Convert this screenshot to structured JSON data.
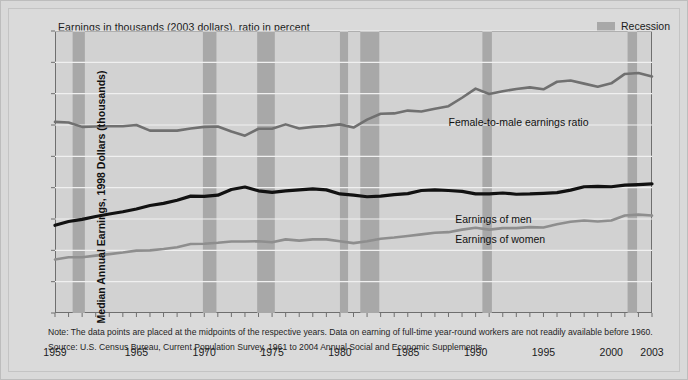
{
  "header": {
    "title": "Earnings in thousands (2003 dollars), ratio in percent",
    "legend_label": "Recession"
  },
  "axes": {
    "ylabel": "Median Annual Earnings, 1998 Dollars (thousands)",
    "yticks": [
      "0",
      "10",
      "20",
      "30",
      "40",
      "50",
      "60",
      "70",
      "80",
      "90"
    ],
    "xticks": [
      "1959",
      "1965",
      "1970",
      "1975",
      "1980",
      "1985",
      "1990",
      "1995",
      "2000",
      "2003"
    ]
  },
  "annotations": {
    "ratio": "Female-to-male earnings ratio",
    "men": "Earnings of men",
    "women": "Earnings of women"
  },
  "notes": {
    "note": "Note: The data points are placed at the midpoints of the respective years. Data on earning of full-time year-round workers are not readily available before 1960.",
    "source": "Source: U.S. Census Bureau, Current Population Survey, 1961 to 2004 Annual Social and Economic Supplements."
  },
  "colors": {
    "page_background": "#d9d9d9",
    "plot_background": "#d2d2d2",
    "recession_band": "#a8a8a8",
    "gridline": "#f0f0f0",
    "axis": "#6f6f6f",
    "men_line": "#111111",
    "women_line": "#8e8e8e",
    "ratio_line": "#707070"
  },
  "chart_data": {
    "type": "line",
    "title": "Earnings in thousands (2003 dollars), ratio in percent",
    "xlabel": "",
    "ylabel": "Median Annual Earnings, 1998 Dollars (thousands)",
    "xlim": [
      1959,
      2003
    ],
    "ylim": [
      0,
      90
    ],
    "grid": true,
    "legend_position": "inline-annotations",
    "x": [
      1959,
      1960,
      1961,
      1962,
      1963,
      1964,
      1965,
      1966,
      1967,
      1968,
      1969,
      1970,
      1971,
      1972,
      1973,
      1974,
      1975,
      1976,
      1977,
      1978,
      1979,
      1980,
      1981,
      1982,
      1983,
      1984,
      1985,
      1986,
      1987,
      1988,
      1989,
      1990,
      1991,
      1992,
      1993,
      1994,
      1995,
      1996,
      1997,
      1998,
      1999,
      2000,
      2001,
      2002,
      2003
    ],
    "series": [
      {
        "name": "Female-to-male earnings ratio",
        "unit": "percent",
        "color": "#707070",
        "values": [
          61.0,
          60.8,
          59.4,
          59.5,
          59.6,
          59.6,
          60.0,
          58.2,
          58.2,
          58.2,
          58.9,
          59.4,
          59.5,
          57.9,
          56.6,
          58.8,
          58.8,
          60.2,
          58.9,
          59.4,
          59.7,
          60.2,
          59.2,
          61.7,
          63.6,
          63.7,
          64.6,
          64.3,
          65.2,
          66.0,
          68.7,
          71.6,
          69.9,
          70.8,
          71.5,
          72.0,
          71.4,
          73.8,
          74.2,
          73.2,
          72.2,
          73.3,
          76.3,
          76.6,
          75.5
        ]
      },
      {
        "name": "Earnings of men",
        "unit": "thousands of 2003 dollars",
        "color": "#111111",
        "values": [
          28.0,
          29.2,
          29.9,
          30.8,
          31.6,
          32.3,
          33.2,
          34.3,
          35.0,
          36.0,
          37.3,
          37.2,
          37.6,
          39.4,
          40.2,
          39.0,
          38.5,
          39.0,
          39.3,
          39.6,
          39.3,
          38.0,
          37.6,
          37.1,
          37.3,
          37.8,
          38.1,
          39.1,
          39.3,
          39.1,
          38.8,
          38.0,
          38.0,
          38.3,
          37.9,
          38.0,
          38.2,
          38.4,
          39.2,
          40.3,
          40.4,
          40.3,
          40.8,
          41.0,
          41.2
        ]
      },
      {
        "name": "Earnings of women",
        "unit": "thousands of 2003 dollars",
        "color": "#8e8e8e",
        "values": [
          17.1,
          17.8,
          17.8,
          18.3,
          18.8,
          19.3,
          19.9,
          20.0,
          20.4,
          21.0,
          22.0,
          22.1,
          22.4,
          22.8,
          22.8,
          22.9,
          22.6,
          23.5,
          23.1,
          23.5,
          23.5,
          22.9,
          22.3,
          22.9,
          23.7,
          24.1,
          24.6,
          25.1,
          25.6,
          25.8,
          26.6,
          27.2,
          26.6,
          27.1,
          27.1,
          27.4,
          27.3,
          28.3,
          29.1,
          29.5,
          29.2,
          29.5,
          31.1,
          31.4,
          31.1
        ]
      }
    ],
    "recessions": [
      {
        "start": 1960.3,
        "end": 1961.2
      },
      {
        "start": 1969.9,
        "end": 1970.9
      },
      {
        "start": 1973.9,
        "end": 1975.2
      },
      {
        "start": 1980.0,
        "end": 1980.6
      },
      {
        "start": 1981.5,
        "end": 1982.9
      },
      {
        "start": 1990.5,
        "end": 1991.2
      },
      {
        "start": 2001.2,
        "end": 2001.9
      }
    ]
  }
}
